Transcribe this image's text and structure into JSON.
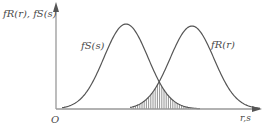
{
  "diagram": {
    "type": "stress-strength interference",
    "y_axis_label": "f_R(r), f_S(s)",
    "y_axis_label_display": "fR(r), fS(s)",
    "x_axis_label": "r,s",
    "origin_label": "O",
    "curves": [
      {
        "name": "stress",
        "label": "fS(s)",
        "peak_x": 126,
        "peak_y": 24
      },
      {
        "name": "strength",
        "label": "fR(r)",
        "peak_x": 192,
        "peak_y": 26
      }
    ],
    "overlap": {
      "description": "hatched interference region",
      "from_x": 131,
      "to_x": 199
    }
  },
  "colors": {
    "curve": "#555555",
    "axis": "#888888",
    "hatch": "#777777",
    "text": "#4a4a4a"
  }
}
